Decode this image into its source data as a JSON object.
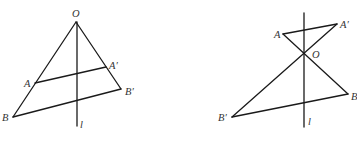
{
  "figures": [
    {
      "name": "same-side-figure",
      "labels": {
        "O": "O",
        "A": "A",
        "A_prime": "A′",
        "B": "B",
        "B_prime": "B′",
        "l": "l"
      }
    },
    {
      "name": "opposite-side-figure",
      "labels": {
        "O": "O",
        "A": "A",
        "A_prime": "A′",
        "B": "B",
        "B_prime": "B′",
        "l": "l"
      }
    }
  ],
  "colors": {
    "line": "#1a1a1a",
    "label": "#333333",
    "background": "#ffffff"
  }
}
